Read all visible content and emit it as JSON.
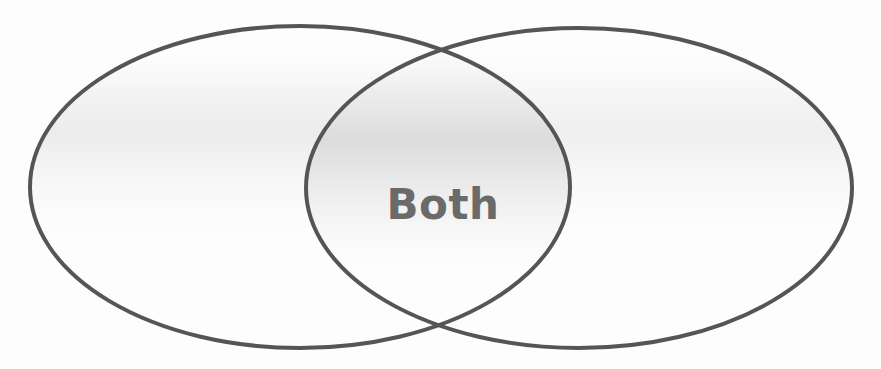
{
  "diagram": {
    "type": "venn",
    "sets": [
      {
        "name": "left-set",
        "label": "",
        "cx": 300,
        "cy": 187,
        "rx": 270,
        "ry": 161
      },
      {
        "name": "right-set",
        "label": "",
        "cx": 579,
        "cy": 188,
        "rx": 273,
        "ry": 160
      }
    ],
    "intersection": {
      "label": "Both",
      "x": 443,
      "y": 205
    },
    "colors": {
      "stroke": "#555555",
      "label": "#6a6a6a",
      "fill": "#ffffff",
      "shade": "#e4e4e4"
    }
  }
}
